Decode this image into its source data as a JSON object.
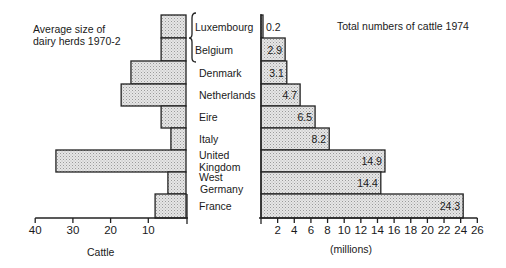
{
  "chart_data": [
    {
      "type": "bar",
      "orientation": "horizontal",
      "direction": "leftward",
      "title": "Average size of dairy herds 1970-2",
      "title_lines": [
        "Average size of",
        "dairy herds 1970-2"
      ],
      "xlabel": "Cattle",
      "ylabel": "",
      "xlim": [
        0,
        40
      ],
      "xticks": [
        10,
        20,
        30,
        40
      ],
      "grid": false,
      "categories": [
        "Luxembourg",
        "Belgium",
        "Denmark",
        "Netherlands",
        "Eire",
        "Italy",
        "United Kingdom",
        "West Germany",
        "France"
      ],
      "values": [
        6.6,
        6.6,
        14.6,
        17.2,
        6.6,
        4.0,
        34.5,
        4.8,
        8.2
      ],
      "note": "Luxembourg and Belgium share one combined bar (bracketed)"
    },
    {
      "type": "bar",
      "orientation": "horizontal",
      "direction": "rightward",
      "title": "Total numbers of cattle 1974",
      "xlabel": "(millions)",
      "ylabel": "",
      "xlim": [
        0,
        26
      ],
      "xticks": [
        2,
        4,
        6,
        8,
        10,
        12,
        14,
        16,
        18,
        20,
        22,
        24,
        26
      ],
      "grid": false,
      "categories": [
        "Luxembourg",
        "Belgium",
        "Denmark",
        "Netherlands",
        "Eire",
        "Italy",
        "United Kingdom",
        "West Germany",
        "France"
      ],
      "values": [
        0.2,
        2.9,
        3.1,
        4.7,
        6.5,
        8.2,
        14.9,
        14.4,
        24.3
      ],
      "data_labels": [
        "0.2",
        "2.9",
        "3.1",
        "4.7",
        "6.5",
        "8.2",
        "14.9",
        "14.4",
        "24.3"
      ]
    }
  ],
  "labels": {
    "left_title_1": "Average size of",
    "left_title_2": "dairy herds 1970-2",
    "right_title": "Total numbers of cattle 1974",
    "left_axis_label": "Cattle",
    "right_axis_label": "(millions)"
  },
  "country_labels": [
    [
      "Luxembourg"
    ],
    [
      "Belgium"
    ],
    [
      "Denmark"
    ],
    [
      "Netherlands"
    ],
    [
      "Eire"
    ],
    [
      "Italy"
    ],
    [
      "United",
      "Kingdom"
    ],
    [
      "West",
      "Germany"
    ],
    [
      "France"
    ]
  ],
  "colors": {
    "bar_fill": "#e4e4e4",
    "stipple_dot": "#9a9a9a",
    "stroke": "#222222",
    "background": "#ffffff"
  }
}
